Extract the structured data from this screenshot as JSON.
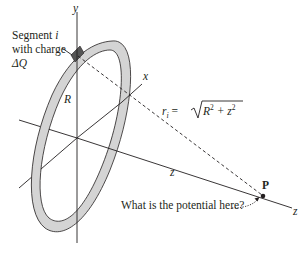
{
  "figure": {
    "labels": {
      "segment_line1": "Segment ",
      "segment_i": "i",
      "segment_line2": "with charge",
      "delta_q": "ΔQ",
      "y_axis": "y",
      "x_axis": "x",
      "z_axis_mid": "z",
      "z_axis_end": "z",
      "radius": "R",
      "point": "P",
      "distance_r": "r",
      "distance_sub": "i",
      "distance_eq": " = ",
      "distance_expr": "R",
      "distance_sq1": "2",
      "distance_plus": " + z",
      "distance_sq2": "2",
      "question": "What is the potential here?"
    },
    "colors": {
      "ring_fill": "#d4d4d4",
      "ring_stroke": "#231f20",
      "segment_fill": "#555555",
      "line": "#231f20",
      "background": "#ffffff"
    }
  }
}
